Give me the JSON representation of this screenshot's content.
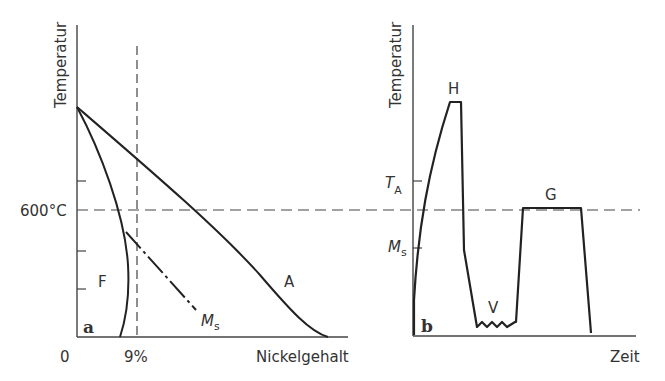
{
  "panel_a": {
    "label": "a",
    "y_axis_label": "Temperatur",
    "x_axis_label": "Nickelgehalt",
    "origin_label": "0",
    "x_marker_label": "9%",
    "y_marker_label": "600°C",
    "region_labels": {
      "ferrite": "F",
      "austenite": "A"
    },
    "ms_label": "M",
    "ms_sub": "s"
  },
  "panel_b": {
    "label": "b",
    "y_axis_label": "Temperatur",
    "x_axis_label": "Zeit",
    "ta_label": "T",
    "ta_sub": "A",
    "ms_label": "M",
    "ms_sub": "s",
    "stage_labels": {
      "hardening": "H",
      "quench": "V",
      "tempering": "G"
    }
  }
}
